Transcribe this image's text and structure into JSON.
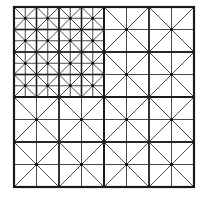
{
  "diagram": {
    "title": "",
    "outer": {
      "x": 14,
      "y": 7,
      "size": 180
    },
    "colors": {
      "stroke": "#1a1a1a",
      "thin": "#333333",
      "background": "#ffffff",
      "node": "#000000"
    },
    "quadrants": [
      {
        "name": "top-left",
        "cells": 4
      },
      {
        "name": "top-right",
        "cells": 2
      },
      {
        "name": "bottom-left",
        "cells": 2
      },
      {
        "name": "bottom-right",
        "cells": 2
      }
    ]
  }
}
